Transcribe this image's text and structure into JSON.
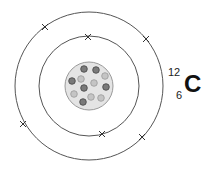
{
  "diagram": {
    "element": {
      "symbol": "C",
      "mass_number": "12",
      "atomic_number": "6"
    },
    "center": [
      89,
      86
    ],
    "shells": [
      {
        "name": "inner",
        "radius": 50,
        "electrons": [
          [
            88,
            37
          ],
          [
            102,
            134
          ]
        ]
      },
      {
        "name": "outer",
        "radius": 74,
        "electrons": [
          [
            45,
            27
          ],
          [
            146,
            39
          ],
          [
            23,
            124
          ],
          [
            142,
            137
          ]
        ]
      }
    ],
    "nucleus": {
      "radius": 24,
      "fill": "#e4e4e4",
      "stroke": "#9a9a9a",
      "neutron_color": "#7a7a7a",
      "proton_color": "#c4c4c4",
      "particles": [
        {
          "type": "neutron",
          "x": 84,
          "y": 69
        },
        {
          "type": "neutron",
          "x": 96,
          "y": 70
        },
        {
          "type": "proton",
          "x": 105,
          "y": 76
        },
        {
          "type": "proton",
          "x": 81,
          "y": 79
        },
        {
          "type": "neutron",
          "x": 72,
          "y": 81
        },
        {
          "type": "proton",
          "x": 94,
          "y": 83
        },
        {
          "type": "neutron",
          "x": 106,
          "y": 87
        },
        {
          "type": "neutron",
          "x": 84,
          "y": 88
        },
        {
          "type": "proton",
          "x": 74,
          "y": 94
        },
        {
          "type": "proton",
          "x": 91,
          "y": 97
        },
        {
          "type": "proton",
          "x": 101,
          "y": 98
        },
        {
          "type": "neutron",
          "x": 83,
          "y": 102
        }
      ]
    },
    "line_color": "#555555"
  }
}
